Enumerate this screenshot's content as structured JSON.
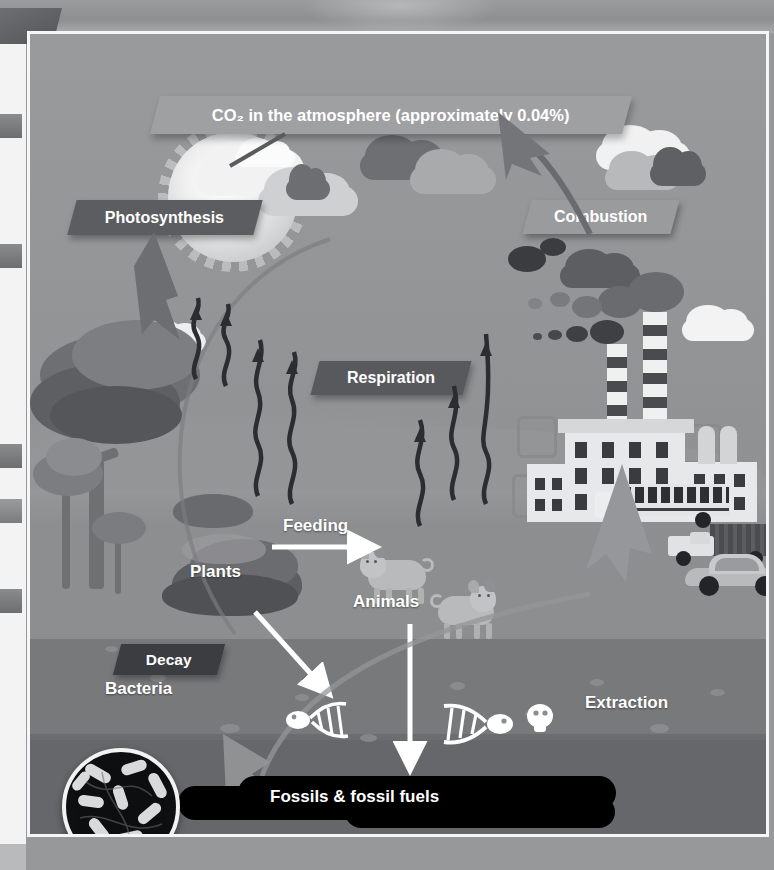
{
  "slide": {
    "title_banner": "CO₂ in the atmosphere (approximately 0.04%)",
    "labels": {
      "photosynthesis": "Photosynthesis",
      "respiration": "Respiration",
      "combustion": "Combustion",
      "decay": "Decay",
      "plants": "Plants",
      "animals": "Animals",
      "feeding": "Feeding",
      "bacteria": "Bacteria",
      "extraction": "Extraction",
      "fossils": "Fossils & fossil fuels"
    },
    "colors": {
      "sky": "#999a9c",
      "ground_upper": "#8d8e90",
      "ground_mid": "#78797b",
      "ground_deep": "#66676a",
      "banner_dark": "#5c5d60",
      "banner_decay": "#3c3d40",
      "banner_light": "#9a9b9d",
      "oil_black": "#000000",
      "frame_white": "#f6f6f6",
      "label_text": "#ffffff"
    }
  },
  "diagram_data": {
    "type": "cycle-diagram",
    "subject": "The Carbon Cycle",
    "nodes": [
      "CO₂ in the atmosphere (approximately 0.04%)",
      "Plants",
      "Animals",
      "Fossils & fossil fuels",
      "Bacteria"
    ],
    "processes": [
      "Photosynthesis",
      "Respiration",
      "Combustion",
      "Decay",
      "Feeding",
      "Extraction"
    ],
    "atmospheric_co2_percent": "0.04%",
    "flows": [
      {
        "from": "CO₂ in the atmosphere",
        "to": "Plants",
        "label": "Photosynthesis"
      },
      {
        "from": "Plants",
        "to": "CO₂ in the atmosphere",
        "label": "Respiration"
      },
      {
        "from": "Animals",
        "to": "CO₂ in the atmosphere",
        "label": "Respiration"
      },
      {
        "from": "Plants",
        "to": "Animals",
        "label": "Feeding"
      },
      {
        "from": "Plants",
        "to": "Bacteria / soil",
        "label": "Decay"
      },
      {
        "from": "Animals",
        "to": "Fossils & fossil fuels",
        "label": "Decay"
      },
      {
        "from": "Fossils & fossil fuels",
        "to": "Industry",
        "label": "Extraction"
      },
      {
        "from": "Industry & vehicles",
        "to": "CO₂ in the atmosphere",
        "label": "Combustion"
      }
    ]
  }
}
